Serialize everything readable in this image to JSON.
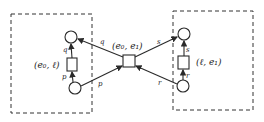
{
  "diagram": {
    "type": "petri-net",
    "components": [
      {
        "id": "left",
        "transition_label": "(e₀, ℓ)"
      },
      {
        "id": "right",
        "transition_label": "(ℓ, e₁)"
      }
    ],
    "center": {
      "transition_label": "(e₀, e₁)"
    },
    "arc_labels": {
      "left_inner_top": "q",
      "left_inner_bottom": "p",
      "left_to_center_top": "q",
      "left_to_center_bottom": "p",
      "center_to_right_top": "s",
      "center_to_right_bottom": "r",
      "right_inner_top": "s",
      "right_inner_bottom": "r"
    }
  }
}
